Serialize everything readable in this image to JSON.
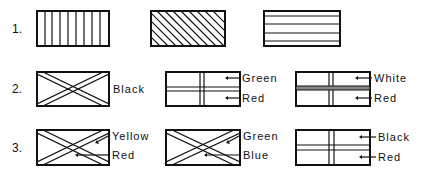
{
  "rows": [
    {
      "number": "1.",
      "items": [
        {
          "pattern": "vertical-stripes",
          "labels": []
        },
        {
          "pattern": "diagonal-stripes",
          "labels": []
        },
        {
          "pattern": "horizontal-stripes",
          "labels": []
        }
      ]
    },
    {
      "number": "2.",
      "items": [
        {
          "pattern": "double-diagonal-cross",
          "labels": [
            "Black"
          ]
        },
        {
          "pattern": "double-line-cross",
          "labels": [
            "Green",
            "Red"
          ]
        },
        {
          "pattern": "double-line-cross-thick-horizontal",
          "labels": [
            "White",
            "Red"
          ]
        }
      ]
    },
    {
      "number": "3.",
      "items": [
        {
          "pattern": "double-diagonal-cross",
          "labels": [
            "Yellow",
            "Red"
          ]
        },
        {
          "pattern": "double-diagonal-cross",
          "labels": [
            "Green",
            "Blue"
          ]
        },
        {
          "pattern": "double-line-cross",
          "labels": [
            "Black",
            "Red"
          ]
        }
      ]
    }
  ],
  "colors": {
    "ink": "#111111",
    "background": "#ffffff"
  }
}
